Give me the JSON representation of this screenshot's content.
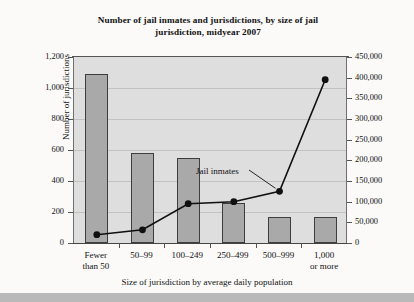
{
  "chart_data": {
    "type": "bar",
    "title": "Number of jail inmates and jurisdictions, by size of jail jurisdiction, midyear 2007",
    "title_line1": "Number of jail inmates and jurisdictions, by size of jail",
    "title_line2": "jurisdiction, midyear 2007",
    "xlabel": "Size of jurisdiction by average daily population",
    "ylabel": "Number of jurisdictions",
    "ylabel_right": "Number of inmates, midyear",
    "categories": [
      "Fewer than 50",
      "50–99",
      "100–249",
      "250–499",
      "500–999",
      "1,000 or more"
    ],
    "category_lines": [
      [
        "Fewer",
        "than 50"
      ],
      [
        "50–99",
        ""
      ],
      [
        "100–249",
        ""
      ],
      [
        "250–499",
        ""
      ],
      [
        "500–999",
        ""
      ],
      [
        "1,000",
        "or more"
      ]
    ],
    "series": [
      {
        "name": "Number of jurisdictions",
        "render": "bar",
        "axis": "left",
        "values": [
          1090,
          580,
          550,
          255,
          170,
          170
        ]
      },
      {
        "name": "Jail inmates",
        "render": "line",
        "axis": "right",
        "values": [
          20000,
          32000,
          95000,
          100000,
          125000,
          395000
        ]
      }
    ],
    "ylim": [
      0,
      1200
    ],
    "yticks": [
      0,
      200,
      400,
      600,
      800,
      1000,
      1200
    ],
    "ytick_labels": [
      "0",
      "200",
      "400",
      "600",
      "800",
      "1,000",
      "1,200"
    ],
    "ylim_right": [
      0,
      450000
    ],
    "yticks_right": [
      0,
      50000,
      100000,
      150000,
      200000,
      250000,
      300000,
      350000,
      400000,
      450000
    ],
    "ytick_labels_right": [
      "0",
      "50,000",
      "100,000",
      "150,000",
      "200,000",
      "250,000",
      "300,000",
      "350,000",
      "400,000",
      "450,000"
    ],
    "grid": true,
    "legend": "none",
    "annotations": [
      {
        "text": "Jail inmates",
        "points_to_category": "500–999"
      }
    ],
    "colors": {
      "bar_fill": "#a9a9a9",
      "bar_edge": "#3d3d3d",
      "line": "#101010",
      "plot_background": "#dedede",
      "gridline": "#c2c2c2",
      "page_background": "#fbfaf8"
    }
  }
}
